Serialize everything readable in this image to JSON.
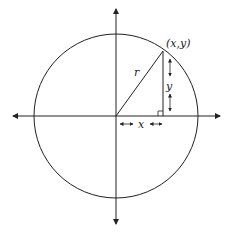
{
  "diagram": {
    "type": "unit-circle-coordinate-diagram",
    "labels": {
      "point": "(x,y)",
      "radius": "r",
      "x_leg": "x",
      "y_leg": "y"
    },
    "colors": {
      "stroke": "#222222",
      "background": "#ffffff"
    },
    "geometry": {
      "center": [
        116,
        116
      ],
      "radius": 80,
      "point": [
        163,
        51
      ]
    }
  }
}
